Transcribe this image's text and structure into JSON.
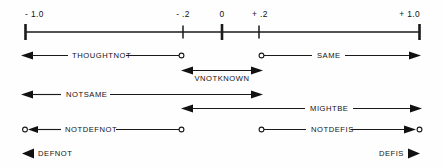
{
  "figure": {
    "background_color": "#fefefe",
    "ink_color": "#111111"
  },
  "axis": {
    "name": "truth-value-axis",
    "min": -1.0,
    "max": 1.0,
    "ticks": [
      {
        "value": -1.0,
        "label": "- 1.0",
        "kind": "major"
      },
      {
        "value": -0.2,
        "label": "- .2",
        "kind": "minor"
      },
      {
        "value": 0.0,
        "label": "0",
        "kind": "major"
      },
      {
        "value": 0.2,
        "label": "+ .2",
        "kind": "minor"
      },
      {
        "value": 1.0,
        "label": "+ 1.0",
        "kind": "major"
      }
    ]
  },
  "rows": [
    {
      "row_index": 0,
      "spans": [
        {
          "label": "THOUGHTNOT",
          "from": -1.0,
          "to": -0.2,
          "left_end": "arrow",
          "right_end": "open-circle",
          "label_pos": 0.3
        },
        {
          "label": "SAME",
          "from": 0.2,
          "to": 1.0,
          "left_end": "open-circle",
          "right_end": "arrow",
          "label_pos": 0.62
        }
      ]
    },
    {
      "row_index": 1,
      "spans": [
        {
          "label": "VNOTKNOWN",
          "from": -0.2,
          "to": 0.2,
          "left_end": "arrow",
          "right_end": "arrow",
          "label_pos": 0.5
        }
      ]
    },
    {
      "row_index": 2,
      "spans": [
        {
          "label": "NOTSAME",
          "from": -1.0,
          "to": 0.2,
          "left_end": "arrow",
          "right_end": "arrow",
          "label_pos": 0.26
        }
      ]
    },
    {
      "row_index": 3,
      "spans": [
        {
          "label": "MIGHTBE",
          "from": -0.2,
          "to": 1.0,
          "left_end": "arrow",
          "right_end": "arrow",
          "label_pos": 0.69
        }
      ]
    },
    {
      "row_index": 4,
      "spans": [
        {
          "label": "NOTDEFNOT",
          "from": -1.0,
          "to": -0.2,
          "left_end": "circle-arrow",
          "right_end": "open-circle",
          "label_pos": 0.36
        },
        {
          "label": "NOTDEFIS",
          "from": 0.2,
          "to": 1.0,
          "left_end": "open-circle",
          "right_end": "arrow-circle",
          "label_pos": 0.57
        }
      ]
    },
    {
      "row_index": 5,
      "spans": [
        {
          "label": "DEFNOT",
          "at": -1.0,
          "marker": "solid-left-triangle",
          "label_side": "right"
        },
        {
          "label": "DEFIS",
          "at": 1.0,
          "marker": "solid-right-triangle",
          "label_side": "left"
        }
      ]
    }
  ],
  "labels": {
    "tick_minus_one": "- 1.0",
    "tick_minus_point_two": "- .2",
    "tick_zero": "0",
    "tick_plus_point_two": "+ .2",
    "tick_plus_one": "+ 1.0",
    "thoughtnot": "THOUGHTNOT",
    "same": "SAME",
    "vnotknown": "VNOTKNOWN",
    "notsame": "NOTSAME",
    "mightbe": "MIGHTBE",
    "notdefnot": "NOTDEFNOT",
    "notdefis": "NOTDEFIS",
    "defnot": "DEFNOT",
    "defis": "DEFIS"
  }
}
